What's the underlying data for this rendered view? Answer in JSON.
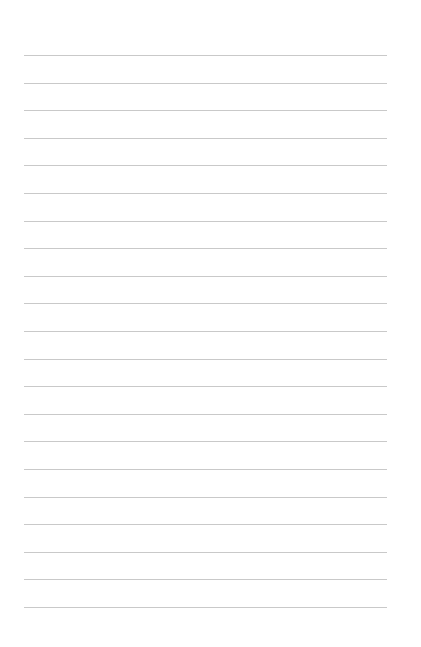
{
  "page": {
    "type": "lined-paper",
    "background_color": "#ffffff",
    "line_color": "#c9c9c9",
    "line_count": 21,
    "line_left": 24,
    "line_right": 387,
    "first_line_y": 55,
    "line_spacing": 27.6,
    "text": ""
  }
}
